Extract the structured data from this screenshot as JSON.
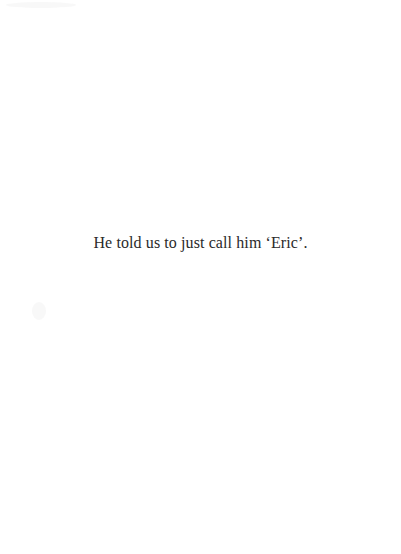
{
  "page": {
    "background": "#ffffff",
    "text_color": "#2a2a2a",
    "lines": [
      "He told us to just call him ‘Eric’."
    ]
  }
}
